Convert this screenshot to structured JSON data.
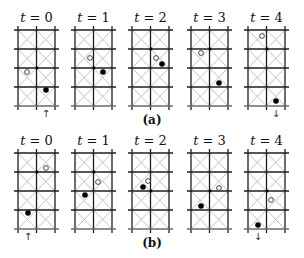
{
  "figure": {
    "width": 304,
    "height": 258,
    "colors": {
      "grid": "#1e1e1e",
      "diagonal": "#b4b4b4",
      "filled_dot": "#000000",
      "hollow_dot_stroke": "#333333",
      "node": "#000000"
    },
    "grid": {
      "cols": 2,
      "rows": 4,
      "cell_w": 18.5,
      "cell_h": 19,
      "overhang": 4
    },
    "rows": [
      {
        "caption": "(a)",
        "caption_x": 152,
        "caption_y": 124,
        "grid_top": 30,
        "label_y": 22,
        "panels": [
          {
            "label_var": "t",
            "label_eq": " = 0",
            "x0": 18,
            "node": [
              37,
              68
            ],
            "hollow": [
              27,
              72
            ],
            "filled": [
              46,
              90
            ],
            "arrow": {
              "dir": "up",
              "glyph": "↑",
              "x": 46,
              "y": 117
            }
          },
          {
            "label_var": "t",
            "label_eq": " = 1",
            "x0": 75,
            "node": [
              94,
              68
            ],
            "hollow": [
              90,
              58
            ],
            "filled": [
              103,
              72
            ],
            "arrow": null
          },
          {
            "label_var": "t",
            "label_eq": " = 2",
            "x0": 132,
            "node": [
              151,
              49
            ],
            "hollow": [
              156,
              58
            ],
            "filled": [
              162,
              64
            ],
            "arrow": null
          },
          {
            "label_var": "t",
            "label_eq": " = 3",
            "x0": 191,
            "node": [
              210,
              49
            ],
            "hollow": [
              201,
              53
            ],
            "filled": [
              219,
              83
            ],
            "arrow": null
          },
          {
            "label_var": "t",
            "label_eq": " = 4",
            "x0": 248,
            "node": [
              267,
              49
            ],
            "hollow": [
              262,
              36
            ],
            "filled": [
              276,
              101
            ],
            "arrow": {
              "dir": "down",
              "glyph": "↓",
              "x": 276,
              "y": 117
            }
          }
        ]
      },
      {
        "caption": "(b)",
        "caption_x": 152,
        "caption_y": 247,
        "grid_top": 153,
        "label_y": 145,
        "panels": [
          {
            "label_var": "t",
            "label_eq": " = 0",
            "x0": 18,
            "node": [
              37,
              172
            ],
            "hollow": [
              46,
              168
            ],
            "filled": [
              28,
              213
            ],
            "arrow": {
              "dir": "up",
              "glyph": "↑",
              "x": 28,
              "y": 240
            }
          },
          {
            "label_var": "t",
            "label_eq": " = 1",
            "x0": 75,
            "node": [
              94,
              172
            ],
            "hollow": [
              98,
              182
            ],
            "filled": [
              85,
              195
            ],
            "arrow": null
          },
          {
            "label_var": "t",
            "label_eq": " = 2",
            "x0": 132,
            "node": [
              151,
              191
            ],
            "hollow": [
              148,
              181
            ],
            "filled": [
              143,
              187
            ],
            "arrow": null
          },
          {
            "label_var": "t",
            "label_eq": " = 3",
            "x0": 191,
            "node": [
              210,
              191
            ],
            "hollow": [
              219,
              188
            ],
            "filled": [
              201,
              206
            ],
            "arrow": null
          },
          {
            "label_var": "t",
            "label_eq": " = 4",
            "x0": 248,
            "node": [
              267,
              191
            ],
            "hollow": [
              271,
              200
            ],
            "filled": [
              258,
              225
            ],
            "arrow": {
              "dir": "down",
              "glyph": "↓",
              "x": 258,
              "y": 240
            }
          }
        ]
      }
    ]
  }
}
